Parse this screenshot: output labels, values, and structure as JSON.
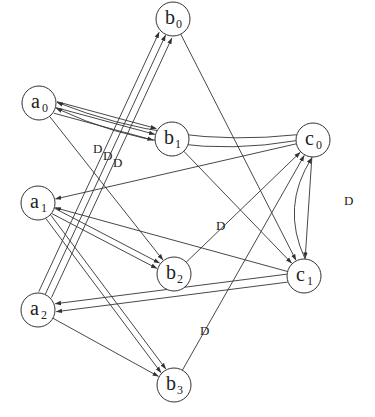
{
  "diagram": {
    "colors": {
      "stroke": "#333333",
      "background": "#ffffff"
    },
    "node_radius": 17,
    "nodes": [
      {
        "id": "b0",
        "base": "b",
        "sub": "0",
        "x": 173,
        "y": 19
      },
      {
        "id": "a0",
        "base": "a",
        "sub": "0",
        "x": 39,
        "y": 103
      },
      {
        "id": "b1",
        "base": "b",
        "sub": "1",
        "x": 172,
        "y": 139
      },
      {
        "id": "c0",
        "base": "c",
        "sub": "0",
        "x": 313,
        "y": 140
      },
      {
        "id": "a1",
        "base": "a",
        "sub": "1",
        "x": 38,
        "y": 203
      },
      {
        "id": "b2",
        "base": "b",
        "sub": "2",
        "x": 174,
        "y": 274
      },
      {
        "id": "c1",
        "base": "c",
        "sub": "1",
        "x": 304,
        "y": 276
      },
      {
        "id": "a2",
        "base": "a",
        "sub": "2",
        "x": 38,
        "y": 310
      },
      {
        "id": "b3",
        "base": "b",
        "sub": "3",
        "x": 174,
        "y": 385
      }
    ],
    "edges": [
      {
        "from": "a0",
        "to": "b1",
        "offset": -6,
        "label": ""
      },
      {
        "from": "a0",
        "to": "b1",
        "offset": 0,
        "label": ""
      },
      {
        "from": "a0",
        "to": "b1",
        "offset": 6,
        "label": ""
      },
      {
        "from": "c0",
        "to": "a0",
        "curve": -38,
        "offset": -3,
        "label": ""
      },
      {
        "from": "c0",
        "to": "a0",
        "curve": -30,
        "offset": 3,
        "label": ""
      },
      {
        "from": "a0",
        "to": "b2",
        "offset": 0,
        "label": ""
      },
      {
        "from": "a2",
        "to": "b0",
        "offset": -7,
        "label": "D"
      },
      {
        "from": "a2",
        "to": "b0",
        "offset": 0,
        "label": "D"
      },
      {
        "from": "a2",
        "to": "b0",
        "offset": 7,
        "label": "D"
      },
      {
        "from": "b0",
        "to": "c1",
        "offset": 0,
        "label": ""
      },
      {
        "from": "b1",
        "to": "c1",
        "offset": 0,
        "label": ""
      },
      {
        "from": "c0",
        "to": "a1",
        "offset": 0,
        "label": ""
      },
      {
        "from": "c0",
        "to": "c1",
        "offset": 0,
        "label": ""
      },
      {
        "from": "c1",
        "to": "c0",
        "curve": -28,
        "offset": 0,
        "label": "D"
      },
      {
        "from": "a1",
        "to": "b2",
        "offset": -3,
        "label": ""
      },
      {
        "from": "a1",
        "to": "b2",
        "offset": 3,
        "label": ""
      },
      {
        "from": "a1",
        "to": "b3",
        "offset": -3,
        "label": ""
      },
      {
        "from": "a1",
        "to": "b3",
        "offset": 3,
        "label": ""
      },
      {
        "from": "c1",
        "to": "a1",
        "offset": 0,
        "label": ""
      },
      {
        "from": "b2",
        "to": "c0",
        "offset": 0,
        "label": "D"
      },
      {
        "from": "c1",
        "to": "a2",
        "offset": -4,
        "label": ""
      },
      {
        "from": "c1",
        "to": "a2",
        "offset": 4,
        "label": ""
      },
      {
        "from": "a2",
        "to": "b3",
        "offset": 0,
        "label": ""
      },
      {
        "from": "b3",
        "to": "c0",
        "offset": 0,
        "label": "D"
      }
    ],
    "edge_labels": [
      {
        "text": "D",
        "x": 93,
        "y": 153
      },
      {
        "text": "D",
        "x": 103,
        "y": 160
      },
      {
        "text": "D",
        "x": 113,
        "y": 167
      },
      {
        "text": "D",
        "x": 216,
        "y": 230
      },
      {
        "text": "D",
        "x": 200,
        "y": 335
      },
      {
        "text": "D",
        "x": 344,
        "y": 205
      }
    ]
  }
}
